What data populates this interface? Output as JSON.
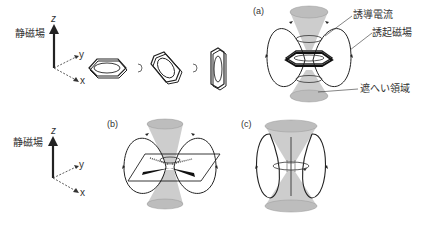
{
  "labels": {
    "static_field_top": "静磁場",
    "static_field_bottom": "静磁場",
    "induced_current": "誘導電流",
    "induced_field": "誘起磁場",
    "shielding_region": "遮へい領域"
  },
  "axes": {
    "z": "z",
    "y": "y",
    "x": "x"
  },
  "panels": [
    {
      "id": "a",
      "label": "(a)"
    },
    {
      "id": "b",
      "label": "(b)"
    },
    {
      "id": "c",
      "label": "(c)"
    }
  ],
  "colors": {
    "cone_fill": "#c8c8c8",
    "line": "#222222",
    "background": "#ffffff"
  }
}
